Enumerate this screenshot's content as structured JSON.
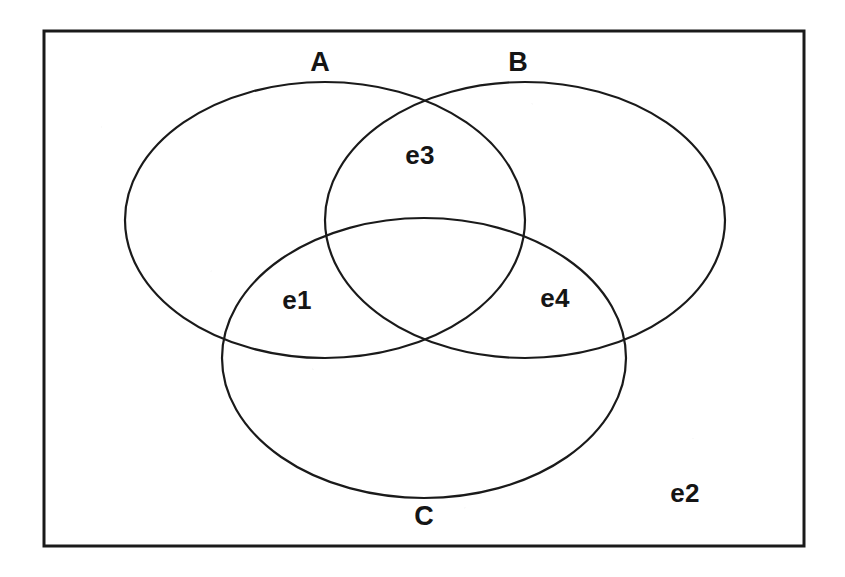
{
  "figure": {
    "type": "venn-diagram",
    "background_color": "#ffffff",
    "stroke_color": "#1a1a1a",
    "text_color": "#151515"
  },
  "universe_box": {
    "name": "universal-set-rectangle",
    "x": 44,
    "y": 31,
    "width": 760,
    "height": 515,
    "stroke_width": 3
  },
  "sets": [
    {
      "id": "A",
      "label": "A",
      "label_x": 320,
      "label_y": 62,
      "cx": 325,
      "cy": 220,
      "rx": 200,
      "ry": 138,
      "stroke_width": 2.2
    },
    {
      "id": "B",
      "label": "B",
      "label_x": 518,
      "label_y": 62,
      "cx": 525,
      "cy": 220,
      "rx": 200,
      "ry": 138,
      "stroke_width": 2.2
    },
    {
      "id": "C",
      "label": "C",
      "label_x": 424,
      "label_y": 516,
      "cx": 424,
      "cy": 358,
      "rx": 202,
      "ry": 140,
      "stroke_width": 2.2
    }
  ],
  "region_labels": [
    {
      "id": "e1",
      "label": "e1",
      "x": 297,
      "y": 300,
      "region": "A and C only"
    },
    {
      "id": "e2",
      "label": "e2",
      "x": 685,
      "y": 493,
      "region": "outside all sets"
    },
    {
      "id": "e3",
      "label": "e3",
      "x": 420,
      "y": 155,
      "region": "A and B only"
    },
    {
      "id": "e4",
      "label": "e4",
      "x": 555,
      "y": 298,
      "region": "B and C only"
    }
  ]
}
